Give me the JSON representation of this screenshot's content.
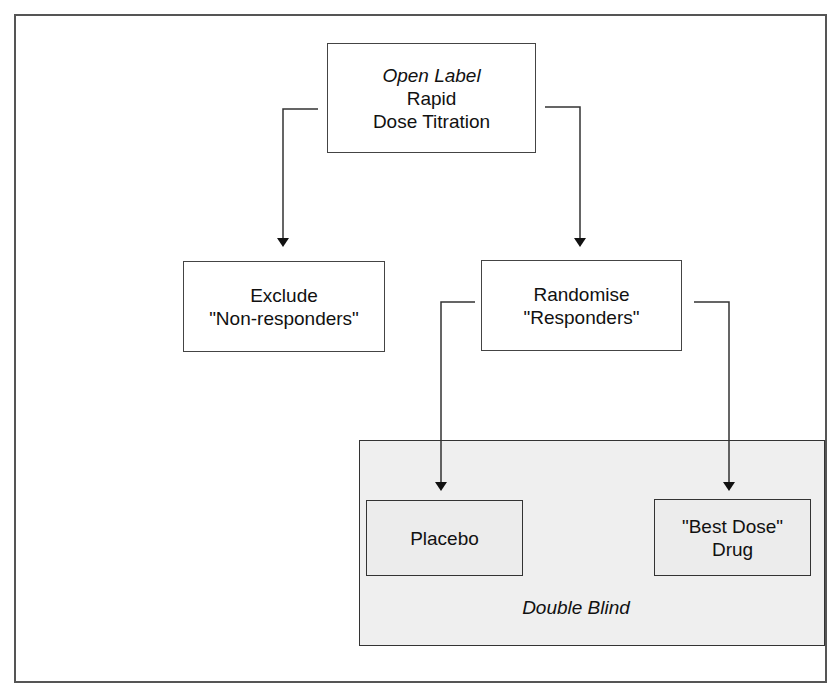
{
  "diagram": {
    "type": "flowchart",
    "title": "",
    "nodes": {
      "start": {
        "line1": "Open Label",
        "line2": "Rapid",
        "line3": "Dose Titration"
      },
      "exclude": {
        "line1": "Exclude",
        "line2": "\"Non-responders\""
      },
      "randomise": {
        "line1": "Randomise",
        "line2": "\"Responders\""
      },
      "placebo": {
        "line1": "Placebo"
      },
      "drug": {
        "line1": "\"Best Dose\"",
        "line2": "Drug"
      }
    },
    "group": {
      "label": "Double Blind",
      "members": [
        "placebo",
        "drug"
      ]
    },
    "edges": [
      {
        "from": "start",
        "to": "exclude"
      },
      {
        "from": "start",
        "to": "randomise"
      },
      {
        "from": "randomise",
        "to": "placebo"
      },
      {
        "from": "randomise",
        "to": "drug"
      }
    ],
    "colors": {
      "line": "#333333",
      "group_fill": "#efefef",
      "background": "#ffffff"
    }
  }
}
